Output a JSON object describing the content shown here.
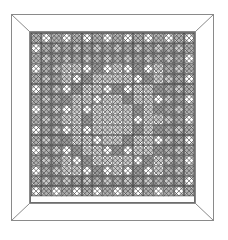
{
  "figure": {
    "title": "",
    "type": "geometric-quilt-pattern",
    "background_color": "#ffffff",
    "canvas": {
      "width": 228,
      "height": 234
    }
  },
  "frame": {
    "name": "outer-frame",
    "outer": {
      "x": 11,
      "y": 14,
      "width": 202,
      "height": 206
    },
    "inner": {
      "x": 29,
      "y": 31,
      "width": 166,
      "height": 172
    },
    "border_color": "#8a8a8a",
    "fill_color": "#ffffff",
    "miter_corners": true,
    "miter_color": "#8a8a8a",
    "stroke_width": 1
  },
  "inner_border": {
    "name": "inner-border-line",
    "x": 30,
    "y": 32,
    "width": 164,
    "height": 170,
    "color": "#6e6e6e",
    "stroke_width": 1
  },
  "grid": {
    "name": "tile-grid",
    "cols": 16,
    "rows": 16,
    "origin": {
      "x": 31,
      "y": 33
    },
    "cell": 10.2,
    "line_color": "#4a4a4a",
    "line_width": 0.7,
    "motif": "square-with-inscribed-diamond-and-x-diagonals"
  },
  "palette": {
    "white": "#ffffff",
    "light_gray": "#c9c9c9",
    "mid_gray": "#b0b0b0",
    "dark_gray": "#9a9a9a",
    "darker_gray": "#8c8c8c",
    "outline": "#4a4a4a"
  },
  "chart_data": {
    "type": "heatmap",
    "title": "",
    "xlabel": "",
    "ylabel": "",
    "grid": true,
    "legend": "none",
    "ring_levels": [
      [
        1,
        1,
        1,
        1,
        1,
        1,
        1,
        1,
        1,
        1,
        1,
        1,
        1,
        1,
        1,
        1
      ],
      [
        1,
        3,
        3,
        3,
        3,
        3,
        3,
        3,
        3,
        3,
        3,
        3,
        3,
        3,
        3,
        1
      ],
      [
        1,
        3,
        3,
        3,
        3,
        3,
        3,
        3,
        3,
        3,
        3,
        3,
        3,
        3,
        3,
        1
      ],
      [
        1,
        3,
        3,
        0,
        0,
        2,
        2,
        2,
        0,
        2,
        2,
        2,
        0,
        3,
        3,
        1
      ],
      [
        1,
        3,
        3,
        0,
        2,
        2,
        0,
        0,
        0,
        0,
        2,
        2,
        0,
        3,
        3,
        1
      ],
      [
        1,
        3,
        3,
        2,
        2,
        0,
        0,
        2,
        2,
        2,
        0,
        0,
        2,
        3,
        3,
        1
      ],
      [
        1,
        3,
        3,
        2,
        0,
        0,
        2,
        0,
        0,
        2,
        0,
        0,
        2,
        3,
        3,
        1
      ],
      [
        1,
        3,
        3,
        2,
        0,
        2,
        0,
        0,
        0,
        0,
        2,
        0,
        2,
        3,
        3,
        1
      ],
      [
        1,
        3,
        3,
        0,
        0,
        2,
        0,
        0,
        0,
        0,
        2,
        0,
        0,
        3,
        3,
        1
      ],
      [
        1,
        3,
        3,
        2,
        0,
        2,
        0,
        0,
        0,
        0,
        2,
        0,
        2,
        3,
        3,
        1
      ],
      [
        1,
        3,
        3,
        2,
        0,
        0,
        2,
        0,
        0,
        2,
        0,
        0,
        2,
        3,
        3,
        1
      ],
      [
        1,
        3,
        3,
        2,
        2,
        0,
        0,
        2,
        2,
        2,
        0,
        0,
        2,
        3,
        3,
        1
      ],
      [
        1,
        3,
        3,
        0,
        2,
        2,
        0,
        0,
        0,
        0,
        2,
        2,
        0,
        3,
        3,
        1
      ],
      [
        1,
        3,
        3,
        0,
        0,
        2,
        2,
        2,
        0,
        2,
        2,
        2,
        0,
        3,
        3,
        1
      ],
      [
        1,
        3,
        3,
        3,
        3,
        3,
        3,
        3,
        3,
        3,
        3,
        3,
        3,
        3,
        3,
        1
      ],
      [
        1,
        1,
        1,
        1,
        1,
        1,
        1,
        1,
        1,
        1,
        1,
        1,
        1,
        1,
        1,
        1
      ]
    ],
    "level_colors": [
      "#ffffff",
      "#c9c9c9",
      "#b0b0b0",
      "#9a9a9a"
    ]
  }
}
